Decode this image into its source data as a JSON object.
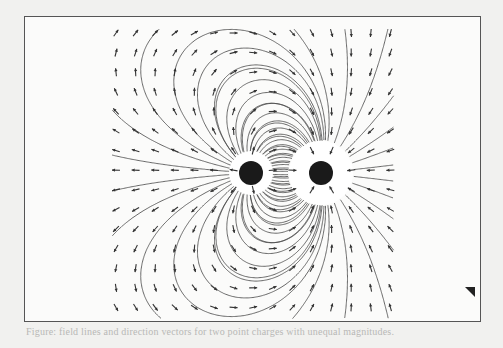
{
  "figure": {
    "type": "electric-field-diagram",
    "charges": [
      {
        "id": "left-charge",
        "cx": 251,
        "cy": 173,
        "core_radius": 12,
        "halo_radius": 22
      },
      {
        "id": "right-charge",
        "cx": 321,
        "cy": 173,
        "core_radius": 12,
        "halo_radius": 32
      }
    ],
    "grid": {
      "x_start": 116,
      "x_end": 390,
      "y_start": 33,
      "y_end": 313,
      "step": 19.6
    },
    "colors": {
      "line": "#444444",
      "core": "#1a1a1a",
      "background": "#fbfbfa",
      "frame": "#555555"
    }
  },
  "caption": {
    "text": "Figure: field lines and direction vectors for two point charges with unequal magnitudes."
  }
}
